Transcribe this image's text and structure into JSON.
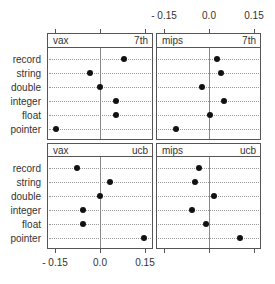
{
  "chart_data": {
    "type": "scatter",
    "subtype": "dotplot (trellis)",
    "categories": [
      "record",
      "string",
      "double",
      "integer",
      "float",
      "pointer"
    ],
    "xlim": [
      -0.17,
      0.18
    ],
    "xticks": [
      -0.15,
      0.0,
      0.15
    ],
    "xtick_labels": [
      "- 0.15",
      "0.0",
      "0.15"
    ],
    "reference_line": 0.0,
    "panels": [
      {
        "machine": "vax",
        "compiler": "7th",
        "values": [
          0.079,
          -0.033,
          0.0,
          0.054,
          0.054,
          -0.147
        ]
      },
      {
        "machine": "mips",
        "compiler": "7th",
        "values": [
          0.027,
          0.041,
          -0.022,
          0.051,
          0.003,
          -0.11
        ]
      },
      {
        "machine": "vax",
        "compiler": "ucb",
        "values": [
          -0.078,
          0.033,
          0.0,
          -0.056,
          -0.056,
          0.146
        ]
      },
      {
        "machine": "mips",
        "compiler": "ucb",
        "values": [
          -0.032,
          -0.047,
          0.017,
          -0.058,
          -0.011,
          0.104
        ]
      }
    ],
    "title": "",
    "xlabel": "",
    "ylabel": ""
  },
  "axis": {
    "top_labels": [
      "- 0.15",
      "0.0",
      "0.15"
    ],
    "bottom_labels": [
      "- 0.15",
      "0.0",
      "0.15"
    ]
  },
  "row_labels": [
    "record",
    "string",
    "double",
    "integer",
    "float",
    "pointer"
  ],
  "strips": [
    {
      "left": "vax",
      "right": "7th"
    },
    {
      "left": "mips",
      "right": "7th"
    },
    {
      "left": "vax",
      "right": "ucb"
    },
    {
      "left": "mips",
      "right": "ucb"
    }
  ]
}
